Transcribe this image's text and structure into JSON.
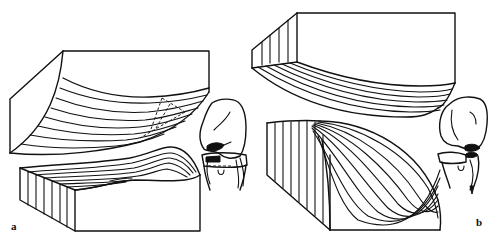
{
  "figure": {
    "background_color": "#ffffff",
    "line_color": "#111111",
    "panels": [
      {
        "id": "a",
        "label": "a",
        "description": "Two opposing blocks with curved layered strata (upper block curving down, lower block with wave-shaped surface) and a dashed triangular outline; small knee joint sketch at right",
        "upper_block_layer_lines": 8,
        "lower_block_slats": 7,
        "has_dashed_outline": true
      },
      {
        "id": "b",
        "label": "b",
        "description": "Upper block with stepped slatted left face and fan of curved layers beneath; lower block with slatted left face and fan-shaped layers sweeping down to the right; small knee joint sketch at right",
        "upper_block_layer_lines": 7,
        "lower_block_slats": 8,
        "lower_block_fan_lines": 9
      }
    ]
  }
}
